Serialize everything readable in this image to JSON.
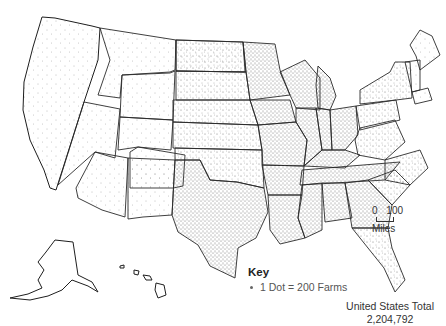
{
  "map": {
    "title": "Farms in the United States",
    "region": "United States (contiguous, Alaska, Hawaii)",
    "style": "dot density",
    "dot_color": "#666666",
    "border_color": "#2a2a2a"
  },
  "key": {
    "title": "Key",
    "entries": [
      {
        "symbol": "dot",
        "label": "1 Dot = 200 Farms"
      }
    ]
  },
  "scale_bar": {
    "start": "0",
    "end": "100",
    "unit": "Miles"
  },
  "total": {
    "label": "United States Total",
    "value": "2,204,792"
  }
}
